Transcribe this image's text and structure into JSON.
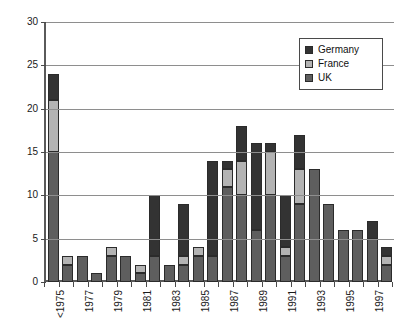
{
  "chart_data": {
    "type": "bar",
    "subtype": "stacked-bar",
    "title": "",
    "xlabel": "",
    "ylabel": "",
    "ylim": [
      0,
      30
    ],
    "ytick_labels": [
      "0",
      "5",
      "10",
      "15",
      "20",
      "25",
      "30"
    ],
    "ytick_values": [
      0,
      5,
      10,
      15,
      20,
      25,
      30
    ],
    "grid": true,
    "legend_position": "top-right",
    "categories": [
      "<1975",
      "1976",
      "1977",
      "1978",
      "1979",
      "1980",
      "1981",
      "1982",
      "1983",
      "1984",
      "1985",
      "1986",
      "1987",
      "1988",
      "1989",
      "1990",
      "1991",
      "1992",
      "1993",
      "1994",
      "1995",
      "1996",
      "1997",
      "1998"
    ],
    "tick_labels": [
      "<1975",
      "",
      "1976",
      "",
      "1978",
      "",
      "1980",
      "",
      "1982",
      "",
      "1984",
      "",
      "1986",
      "",
      "1988",
      "",
      "1990",
      "",
      "1992",
      "",
      "1994",
      "",
      "1996",
      "",
      "1998"
    ],
    "labeled_categories": [
      "<1975",
      "1976",
      "1978",
      "1980",
      "1982",
      "1984",
      "1986",
      "1988",
      "1990",
      "1992",
      "1994",
      "1996",
      "1998"
    ],
    "series": [
      {
        "name": "UK",
        "color": "#5e5e5e",
        "values": [
          15,
          2,
          3,
          1,
          3,
          3,
          1,
          3,
          2,
          2,
          3,
          3,
          11,
          10,
          6,
          10,
          3,
          9,
          13,
          9,
          6,
          6,
          5,
          2
        ]
      },
      {
        "name": "France",
        "color": "#b3b3b3",
        "values": [
          6,
          1,
          0,
          0,
          1,
          0,
          1,
          0,
          0,
          1,
          1,
          0,
          2,
          4,
          0,
          5,
          1,
          4,
          0,
          0,
          0,
          0,
          0,
          1
        ]
      },
      {
        "name": "Germany",
        "color": "#333333",
        "values": [
          3,
          0,
          0,
          0,
          0,
          0,
          0,
          7,
          0,
          6,
          0,
          11,
          1,
          4,
          10,
          1,
          6,
          4,
          0,
          0,
          0,
          0,
          2,
          1
        ]
      }
    ],
    "totals": [
      24,
      3,
      3,
      1,
      4,
      3,
      2,
      10,
      2,
      9,
      4,
      14,
      14,
      18,
      16,
      16,
      10,
      17,
      13,
      9,
      6,
      6,
      7,
      4
    ]
  },
  "legend": {
    "items": [
      {
        "label": "Germany",
        "color": "#333333",
        "swatch": "germany-swatch"
      },
      {
        "label": "France",
        "color": "#b3b3b3",
        "swatch": "france-swatch"
      },
      {
        "label": "UK",
        "color": "#5e5e5e",
        "swatch": "uk-swatch"
      }
    ]
  },
  "colors": {
    "germany": "#333333",
    "france": "#b3b3b3",
    "uk": "#5e5e5e",
    "axis": "#5a5a5a",
    "grid": "#8e8e8e",
    "background": "#ffffff",
    "text": "#111111"
  }
}
